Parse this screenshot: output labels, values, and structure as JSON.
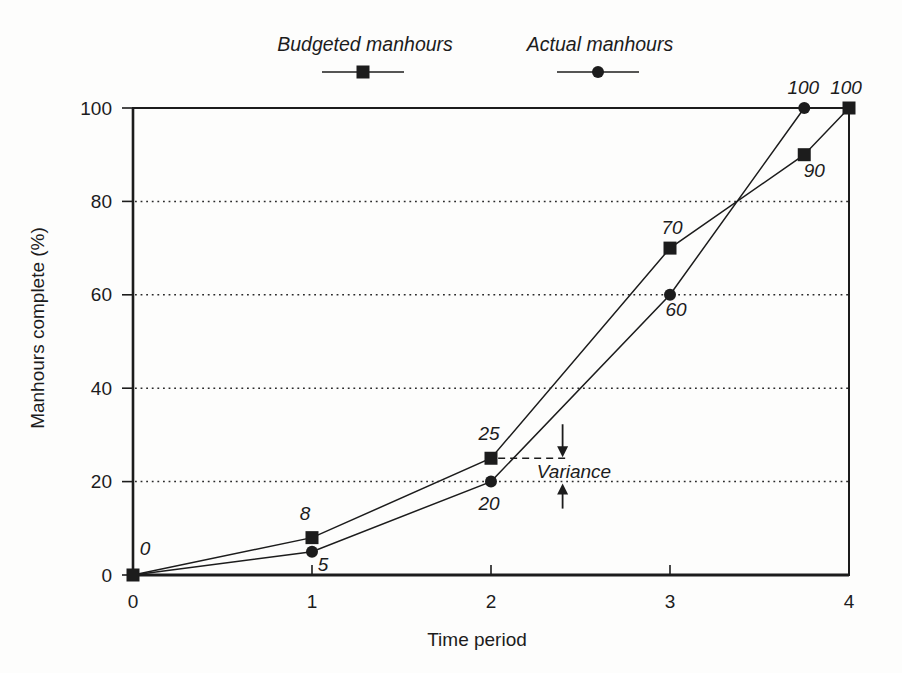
{
  "figure": {
    "background": "#fdfdfc",
    "ink": "#1c1c1c"
  },
  "legend": {
    "items": [
      {
        "label": "Budgeted manhours",
        "marker": "square"
      },
      {
        "label": "Actual manhours",
        "marker": "circle"
      }
    ]
  },
  "chart_data": {
    "type": "line",
    "title": "",
    "xlabel": "Time period",
    "ylabel": "Manhours complete (%)",
    "xlim": [
      0,
      4
    ],
    "ylim": [
      0,
      100
    ],
    "x_ticks": [
      "0",
      "1",
      "2",
      "3",
      "4"
    ],
    "x_tick_values": [
      0,
      1,
      2,
      3,
      4
    ],
    "y_ticks": [
      "0",
      "20",
      "40",
      "60",
      "80",
      "100"
    ],
    "y_tick_values": [
      0,
      20,
      40,
      60,
      80,
      100
    ],
    "grid": "horizontal dotted lines at y=20,40,60,80; full box frame",
    "legend_position": "top-center",
    "series": [
      {
        "name": "Budgeted manhours",
        "marker": "square",
        "points": [
          {
            "x": 0,
            "y": 0,
            "label": "0",
            "dx": 12,
            "dy": -20
          },
          {
            "x": 1,
            "y": 8,
            "label": "8",
            "dx": -7,
            "dy": -18
          },
          {
            "x": 2,
            "y": 25,
            "label": "25",
            "dx": -2,
            "dy": -18
          },
          {
            "x": 3,
            "y": 70,
            "label": "70",
            "dx": 2,
            "dy": -14
          },
          {
            "x": 3.75,
            "y": 90,
            "label": "90",
            "dx": 10,
            "dy": 22
          },
          {
            "x": 4,
            "y": 100,
            "label": "100",
            "dx": -3,
            "dy": -14
          }
        ]
      },
      {
        "name": "Actual manhours",
        "marker": "circle",
        "points": [
          {
            "x": 0,
            "y": 0,
            "label": "",
            "dx": 0,
            "dy": 0
          },
          {
            "x": 1,
            "y": 5,
            "label": "5",
            "dx": 11,
            "dy": 19
          },
          {
            "x": 2,
            "y": 20,
            "label": "20",
            "dx": -2,
            "dy": 28
          },
          {
            "x": 3,
            "y": 60,
            "label": "60",
            "dx": 6,
            "dy": 21
          },
          {
            "x": 3.75,
            "y": 100,
            "label": "100",
            "dx": -1,
            "dy": -14
          }
        ]
      }
    ],
    "annotation": {
      "text": "Variance",
      "dash_y": 25,
      "dash_from_x": 2.04,
      "dash_to_x": 2.44,
      "arrow_x": 2.4,
      "gap_top_y": 25,
      "gap_bottom_y": 20
    }
  }
}
